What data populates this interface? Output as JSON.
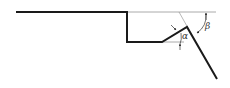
{
  "diagram": {
    "type": "angle-geometry",
    "labels": {
      "alpha": "α",
      "beta": "β"
    },
    "colors": {
      "profile": "#1a1a1a",
      "reference": "#a0a0a0",
      "background": "#ffffff"
    }
  }
}
